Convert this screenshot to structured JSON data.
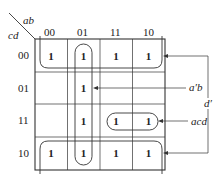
{
  "kmap": {
    "row_var": "cd",
    "col_var": "ab",
    "columns": [
      "00",
      "01",
      "11",
      "10"
    ],
    "rows": [
      "00",
      "01",
      "11",
      "10"
    ],
    "cells": [
      [
        "1",
        "1",
        "1",
        "1"
      ],
      [
        "",
        "1",
        "",
        ""
      ],
      [
        "",
        "1",
        "1",
        "1"
      ],
      [
        "1",
        "1",
        "1",
        "1"
      ]
    ]
  },
  "groups": [
    {
      "term": "d'",
      "label": "d′",
      "cells": "rows 00 and 10 (wraparound)"
    },
    {
      "term": "a'b",
      "label": "a′b",
      "cells": "column 01"
    },
    {
      "term": "acd",
      "label": "acd",
      "cells": "row 11, columns 11 and 10"
    }
  ],
  "colors": {
    "line": "#333333",
    "text": "#222222",
    "background": "#ffffff"
  }
}
